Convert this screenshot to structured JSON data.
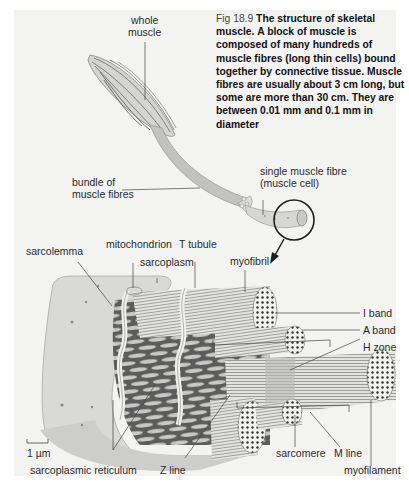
{
  "caption": {
    "figure_number": "Fig 18.9",
    "title": "The structure of skeletal muscle.",
    "text": "A block of muscle is composed of many hundreds of muscle fibres (long thin cells) bound together by connective tissue. Muscle fibres are usually about 3 cm long, but some are more than 30 cm. They are between 0.01 mm and 0.1 mm in diameter"
  },
  "labels": {
    "whole_muscle_1": "whole",
    "whole_muscle_2": "muscle",
    "bundle_1": "bundle of",
    "bundle_2": "muscle fibres",
    "single_fibre_1": "single muscle fibre",
    "single_fibre_2": "(muscle cell)",
    "sarcolemma": "sarcolemma",
    "mitochondrion": "mitochondrion",
    "sarcoplasm": "sarcoplasm",
    "t_tubule": "T tubule",
    "myofibril": "myofibril",
    "i_band": "I band",
    "a_band": "A band",
    "h_zone": "H zone",
    "sarcomere": "sarcomere",
    "m_line": "M line",
    "myofilament": "myofilament",
    "z_line": "Z line",
    "sarcoplasmic_reticulum": "sarcoplasmic reticulum",
    "scale_bar": "1 µm"
  },
  "colors": {
    "panel_bg": "#f3f3f2",
    "tissue_light": "#cfcfcd",
    "tissue_mid": "#b8b8b6",
    "tissue_dark": "#5a5a5a",
    "fibre_line": "#8a8a8a",
    "dot": "#3a3a3a",
    "leader": "#444444"
  }
}
